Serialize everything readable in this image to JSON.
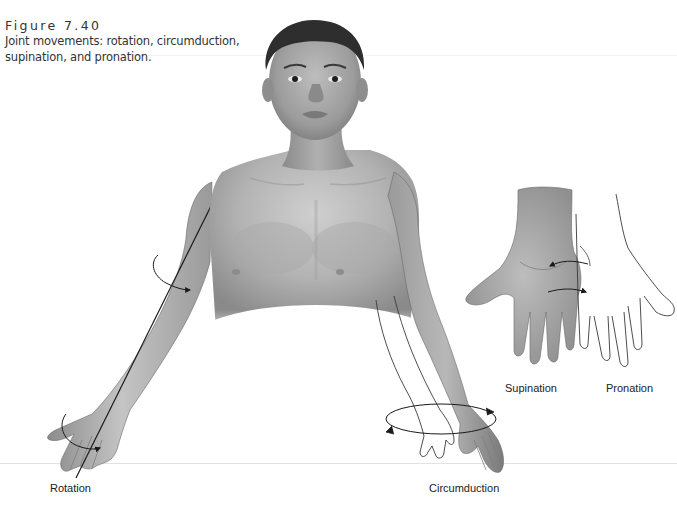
{
  "figure": {
    "label": "Figure 7.40",
    "caption_line1": "Joint movements: rotation, circumduction,",
    "caption_line2": "supination, and pronation.",
    "caption": "Joint movements: rotation, circumduction, supination, and pronation."
  },
  "labels": {
    "rotation": "Rotation",
    "circumduction": "Circumduction",
    "supination": "Supination",
    "pronation": "Pronation"
  },
  "illustration": {
    "subject": "Front view of human figure, head and upper torso, arms extended",
    "style": "grayscale shaded drawing with black line arrows",
    "elements": [
      "head-and-torso",
      "right-arm-with-rotation-axis-and-arrows",
      "left-arm-with-circumduction-ellipse",
      "supination-hand-palm-up",
      "pronation-hand-outline"
    ]
  },
  "colors": {
    "background": "#ffffff",
    "skin_light": "#d8d8d8",
    "skin_mid": "#a9a9a9",
    "skin_dark": "#6e6e6e",
    "hair": "#2e2e2e",
    "line": "#1a1a1a",
    "text": "#222222"
  }
}
